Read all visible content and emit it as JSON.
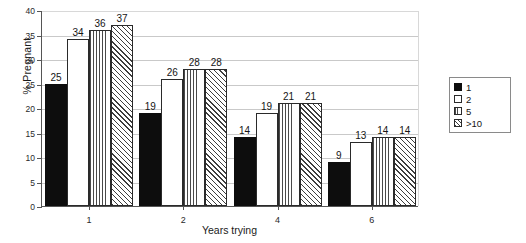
{
  "chart_data": {
    "type": "bar",
    "title": "",
    "xlabel": "Years trying",
    "ylabel": "% Pregnant",
    "categories": [
      "1",
      "2",
      "4",
      "6"
    ],
    "series": [
      {
        "name": "1",
        "values": [
          25,
          19,
          14,
          9
        ]
      },
      {
        "name": "2",
        "values": [
          34,
          26,
          19,
          13
        ]
      },
      {
        "name": "5",
        "values": [
          36,
          28,
          21,
          14
        ]
      },
      {
        "name": ">10",
        "values": [
          37,
          28,
          21,
          14
        ]
      }
    ],
    "ylim": [
      0,
      40
    ],
    "yticks": [
      0,
      5,
      10,
      15,
      20,
      25,
      30,
      35,
      40
    ],
    "ytick_labels": [
      "0",
      "5",
      "10",
      "15",
      "20",
      "25",
      "30",
      "35",
      "40"
    ],
    "grid": true,
    "legend_position": "right",
    "data_labels": true
  },
  "legend": {
    "entries": [
      {
        "label": "1",
        "pattern": "solid-black"
      },
      {
        "label": "2",
        "pattern": "white"
      },
      {
        "label": "5",
        "pattern": "vertical-hatch"
      },
      {
        "label": ">10",
        "pattern": "diagonal-hatch"
      }
    ]
  }
}
